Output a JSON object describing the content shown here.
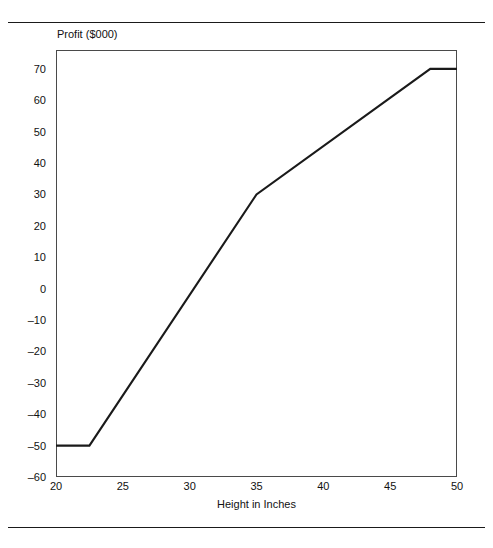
{
  "chart_data": {
    "type": "line",
    "title": "",
    "xlabel": "Height in Inches",
    "ylabel": "Profit ($000)",
    "xlim": [
      20,
      50
    ],
    "ylim": [
      -60,
      76
    ],
    "grid": false,
    "legend": null,
    "xticks": [
      20,
      25,
      30,
      35,
      40,
      45,
      50
    ],
    "xtick_labels": [
      "20",
      "25",
      "30",
      "35",
      "40",
      "45",
      "50"
    ],
    "yticks": [
      70,
      60,
      50,
      40,
      30,
      20,
      10,
      0,
      -10,
      -20,
      -30,
      -40,
      -50,
      -60
    ],
    "ytick_labels": [
      "70",
      "60",
      "50",
      "40",
      "30",
      "20",
      "10",
      "0",
      "–10",
      "–20",
      "–30",
      "–40",
      "–50",
      "–60"
    ],
    "series": [
      {
        "name": "Profit",
        "color": "#1a1a1a",
        "points": [
          {
            "x": 20,
            "y": -50
          },
          {
            "x": 22.5,
            "y": -50
          },
          {
            "x": 35,
            "y": 30
          },
          {
            "x": 48,
            "y": 70
          },
          {
            "x": 50,
            "y": 70
          }
        ]
      }
    ]
  },
  "axis_labels": {
    "y_title": "Profit ($000)",
    "x_title": "Height in Inches"
  }
}
